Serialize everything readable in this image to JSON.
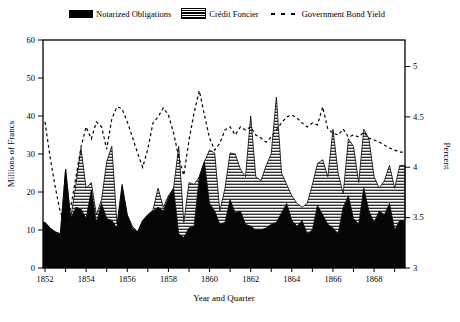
{
  "legend": {
    "items": [
      {
        "label": "Notarized Obligations",
        "swatch": "solid-black-area"
      },
      {
        "label": "Crédit Foncier",
        "swatch": "horizontal-striped-area"
      },
      {
        "label": "Government Bond Yield",
        "swatch": "dashed-line"
      }
    ]
  },
  "axes": {
    "left": {
      "title": "Millions of Francs",
      "min": 0,
      "max": 60,
      "ticks": [
        0,
        10,
        20,
        30,
        40,
        50,
        60
      ]
    },
    "right": {
      "title": "Percent",
      "min": 3,
      "max": 5,
      "ticks": [
        3,
        3.5,
        4,
        4.5,
        5
      ]
    },
    "bottom": {
      "title": "Year and Quarter",
      "year_start": 1852,
      "year_end": 1869,
      "labeled_years": [
        1852,
        1854,
        1856,
        1858,
        1860,
        1862,
        1864,
        1866,
        1868
      ]
    }
  },
  "colors": {
    "ink": "#000000",
    "background": "#ffffff"
  },
  "chart_data": {
    "type": "area",
    "subtype": "stacked-area-with-line",
    "title": "",
    "xlabel": "Year and Quarter",
    "ylabel_left": "Millions of Francs",
    "ylabel_right": "Percent",
    "ylim_left": [
      0,
      60
    ],
    "ylim_right": [
      3,
      5
    ],
    "grid": false,
    "legend_position": "top",
    "quarters": [
      "1852Q1",
      "1852Q2",
      "1852Q3",
      "1852Q4",
      "1853Q1",
      "1853Q2",
      "1853Q3",
      "1853Q4",
      "1854Q1",
      "1854Q2",
      "1854Q3",
      "1854Q4",
      "1855Q1",
      "1855Q2",
      "1855Q3",
      "1855Q4",
      "1856Q1",
      "1856Q2",
      "1856Q3",
      "1856Q4",
      "1857Q1",
      "1857Q2",
      "1857Q3",
      "1857Q4",
      "1858Q1",
      "1858Q2",
      "1858Q3",
      "1858Q4",
      "1859Q1",
      "1859Q2",
      "1859Q3",
      "1859Q4",
      "1860Q1",
      "1860Q2",
      "1860Q3",
      "1860Q4",
      "1861Q1",
      "1861Q2",
      "1861Q3",
      "1861Q4",
      "1862Q1",
      "1862Q2",
      "1862Q3",
      "1862Q4",
      "1863Q1",
      "1863Q2",
      "1863Q3",
      "1863Q4",
      "1864Q1",
      "1864Q2",
      "1864Q3",
      "1864Q4",
      "1865Q1",
      "1865Q2",
      "1865Q3",
      "1865Q4",
      "1866Q1",
      "1866Q2",
      "1866Q3",
      "1866Q4",
      "1867Q1",
      "1867Q2",
      "1867Q3",
      "1867Q4",
      "1868Q1",
      "1868Q2",
      "1868Q3",
      "1868Q4",
      "1869Q1",
      "1869Q2"
    ],
    "series": [
      {
        "name": "Notarized Obligations",
        "axis": "left",
        "style": "solid-black-area",
        "values": [
          12,
          10.5,
          9.5,
          9,
          26,
          13,
          16,
          15.5,
          13,
          20.5,
          12,
          17,
          13,
          12.5,
          10.5,
          21.5,
          13.8,
          10.5,
          9.5,
          12.5,
          14,
          15,
          16,
          15,
          18.5,
          21,
          9,
          8,
          10.5,
          11,
          24,
          28,
          17,
          15,
          11.5,
          12,
          18,
          14.5,
          15,
          11.5,
          11,
          10,
          10,
          10.5,
          11.5,
          12,
          14.5,
          17,
          12.5,
          11,
          12.5,
          9,
          10,
          16.5,
          14,
          11.5,
          10.5,
          9,
          16,
          19,
          13,
          11.5,
          21,
          15,
          12,
          15,
          14,
          17,
          10,
          12.5
        ]
      },
      {
        "name": "Crédit Foncier",
        "axis": "left",
        "style": "striped-area-stacked-on-notarized",
        "values": [
          0,
          0,
          0,
          0,
          0,
          0,
          6,
          16,
          8,
          2,
          2,
          1,
          15,
          19.5,
          1,
          0.5,
          0.2,
          0.5,
          0,
          0,
          0,
          0.3,
          5,
          1,
          0.5,
          0,
          23,
          4,
          12,
          11,
          0,
          0,
          14,
          15.3,
          3.5,
          9,
          12.3,
          15.5,
          11,
          12.5,
          29,
          14,
          13,
          16.4,
          18.5,
          33,
          10.5,
          5,
          6.5,
          6,
          3.5,
          8,
          12,
          11,
          14.5,
          12.5,
          26,
          16,
          3.5,
          15,
          19,
          11,
          15.5,
          19,
          12,
          6,
          9,
          10,
          11,
          14.5
        ]
      },
      {
        "name": "Government Bond Yield",
        "axis": "right",
        "style": "dashed-line",
        "values": [
          4.45,
          4.1,
          3.8,
          3.55,
          3.45,
          3.6,
          3.9,
          4.2,
          4.4,
          4.28,
          4.45,
          4.4,
          4.18,
          4.48,
          4.6,
          4.58,
          4.45,
          4.3,
          4.14,
          4.0,
          4.18,
          4.44,
          4.5,
          4.59,
          4.52,
          4.34,
          4.1,
          3.92,
          4.27,
          4.54,
          4.76,
          4.52,
          4.29,
          4.17,
          4.24,
          4.37,
          4.4,
          4.32,
          4.4,
          4.37,
          4.4,
          4.32,
          4.29,
          4.25,
          4.3,
          4.37,
          4.44,
          4.5,
          4.52,
          4.49,
          4.44,
          4.4,
          4.44,
          4.42,
          4.6,
          4.38,
          4.34,
          4.32,
          4.38,
          4.3,
          4.32,
          4.3,
          4.35,
          4.29,
          4.27,
          4.25,
          4.22,
          4.19,
          4.17,
          4.15
        ]
      }
    ]
  }
}
